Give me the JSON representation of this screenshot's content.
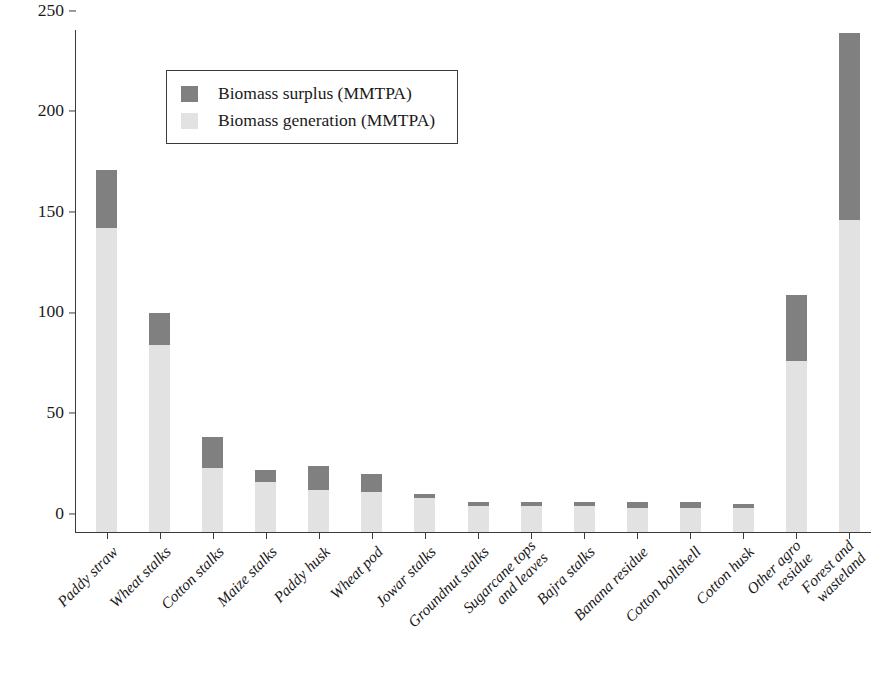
{
  "chart_data": {
    "type": "bar",
    "stacked": true,
    "title": "",
    "xlabel": "",
    "ylabel": "",
    "ylim": [
      0,
      250
    ],
    "yticks": [
      0,
      50,
      100,
      150,
      200,
      250
    ],
    "ytick_labels": [
      "0",
      "50",
      "100",
      "150",
      "200",
      "250"
    ],
    "grid": false,
    "legend_position": "upper left",
    "categories": [
      "Paddy straw",
      "Wheat stalks",
      "Cotton stalks",
      "Maize stalks",
      "Paddy husk",
      "Wheat pod",
      "Jowar stalks",
      "Groundnut stalks",
      "Sugarcane tops and leaves",
      "Bajra stalks",
      "Banana residue",
      "Cotton bollshell",
      "Cotton husk",
      "Other agro residue",
      "Forest and wasteland"
    ],
    "category_lines": [
      [
        "Paddy straw"
      ],
      [
        "Wheat stalks"
      ],
      [
        "Cotton stalks"
      ],
      [
        "Maize stalks"
      ],
      [
        "Paddy husk"
      ],
      [
        "Wheat pod"
      ],
      [
        "Jowar stalks"
      ],
      [
        "Groundnut stalks"
      ],
      [
        "Sugarcane tops",
        "and leaves"
      ],
      [
        "Bajra stalks"
      ],
      [
        "Banana residue"
      ],
      [
        "Cotton bollshell"
      ],
      [
        "Cotton husk"
      ],
      [
        "Other agro",
        "residue"
      ],
      [
        "Forest and",
        "wasteland"
      ]
    ],
    "series": [
      {
        "name": "Biomass generation (MMTPA)",
        "color": "#e2e2e2",
        "values": [
          151,
          93,
          32,
          25,
          21,
          20,
          17,
          13,
          13,
          13,
          12,
          12,
          12,
          85,
          155
        ]
      },
      {
        "name": "Biomass surplus (MMTPA)",
        "color": "#808080",
        "values": [
          29,
          16,
          15,
          6,
          12,
          9,
          2,
          2,
          2,
          2,
          3,
          3,
          2,
          33,
          93
        ]
      }
    ],
    "totals": [
      180,
      109,
      47,
      31,
      33,
      29,
      19,
      15,
      15,
      15,
      15,
      15,
      14,
      118,
      248
    ]
  },
  "legend": {
    "entries": [
      {
        "label": "Biomass surplus (MMTPA)",
        "color": "#808080"
      },
      {
        "label": "Biomass generation (MMTPA)",
        "color": "#e2e2e2"
      }
    ]
  }
}
